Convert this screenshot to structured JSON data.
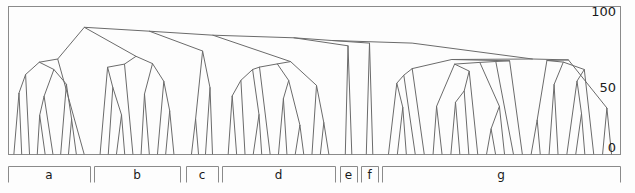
{
  "figure": {
    "type": "dendrogram",
    "plot_box": {
      "x": 8,
      "y": 6,
      "width": 612,
      "height": 148
    },
    "background_color": "#fdfdfd",
    "line_color": "#6b6b6b",
    "axis_color": "#8a8a8a",
    "text_color": "#1a1a1a"
  },
  "axis": {
    "orientation": "right",
    "ticks": [
      {
        "label": "100",
        "value": 100,
        "y": 16
      },
      {
        "label": "50",
        "value": 50,
        "y": 92
      },
      {
        "label": "0",
        "value": 0,
        "y": 152
      }
    ],
    "gridlines": [
      {
        "value": 100,
        "y": 22
      },
      {
        "value": 50,
        "y": 86
      },
      {
        "value": 0,
        "y": 154
      }
    ]
  },
  "groups": [
    {
      "label": "a",
      "x1": 8,
      "x2": 90
    },
    {
      "label": "b",
      "x1": 94,
      "x2": 180
    },
    {
      "label": "c",
      "x1": 186,
      "x2": 218
    },
    {
      "label": "d",
      "x1": 222,
      "x2": 335
    },
    {
      "label": "e",
      "x1": 340,
      "x2": 357
    },
    {
      "label": "f",
      "x1": 361,
      "x2": 378
    },
    {
      "label": "g",
      "x1": 382,
      "x2": 620
    }
  ],
  "bracket": {
    "y_top": 166,
    "y_bottom": 182,
    "label_y": 179
  },
  "chart_data": {
    "type": "dendrogram",
    "title": "",
    "xlabel": "",
    "ylabel": "",
    "ylim": [
      0,
      100
    ],
    "grid": true,
    "legend": "none",
    "categories": [
      "a",
      "b",
      "c",
      "d",
      "e",
      "f",
      "g"
    ],
    "leaves_x": [
      14,
      22,
      30,
      38,
      46,
      54,
      62,
      70,
      78,
      86,
      98,
      106,
      114,
      122,
      130,
      138,
      146,
      154,
      162,
      172,
      190,
      198,
      206,
      214,
      228,
      236,
      244,
      252,
      260,
      268,
      276,
      284,
      292,
      300,
      308,
      316,
      326,
      346,
      352,
      366,
      372,
      388,
      396,
      404,
      412,
      420,
      430,
      440,
      450,
      460,
      470,
      480,
      490,
      500,
      510,
      520,
      530,
      540,
      550,
      560,
      570,
      580,
      590,
      600,
      610
    ],
    "merges": [
      {
        "x": 36,
        "height": 72,
        "children_x": [
          14,
          60
        ],
        "children_h": [
          0,
          30
        ]
      },
      {
        "x": 60,
        "height": 30,
        "children_x": [
          48,
          74
        ],
        "children_h": [
          0,
          18
        ]
      },
      {
        "x": 48,
        "height": 16,
        "children_x": [
          40,
          56
        ],
        "children_h": [
          0,
          0
        ]
      },
      {
        "x": 74,
        "height": 18,
        "children_x": [
          66,
          84
        ],
        "children_h": [
          0,
          0
        ]
      },
      {
        "x": 118,
        "height": 74,
        "children_x": [
          98,
          140
        ],
        "children_h": [
          0,
          54
        ]
      },
      {
        "x": 140,
        "height": 54,
        "children_x": [
          128,
          160
        ],
        "children_h": [
          0,
          0
        ]
      },
      {
        "x": 202,
        "height": 76,
        "children_x": [
          192,
          212
        ],
        "children_h": [
          0,
          0
        ]
      },
      {
        "x": 246,
        "height": 66,
        "children_x": [
          232,
          272
        ],
        "children_h": [
          0,
          42
        ]
      },
      {
        "x": 272,
        "height": 42,
        "children_x": [
          258,
          300
        ],
        "children_h": [
          0,
          48
        ]
      },
      {
        "x": 300,
        "height": 48,
        "children_x": [
          288,
          318
        ],
        "children_h": [
          0,
          0
        ]
      },
      {
        "x": 350,
        "height": 78,
        "children_x": [
          344,
          358
        ],
        "children_h": [
          0,
          0
        ]
      },
      {
        "x": 372,
        "height": 80,
        "children_x": [
          364,
          382
        ],
        "children_h": [
          0,
          0
        ]
      },
      {
        "x": 432,
        "height": 64,
        "children_x": [
          418,
          470
        ],
        "children_h": [
          0,
          34
        ]
      },
      {
        "x": 470,
        "height": 34,
        "children_x": [
          452,
          500
        ],
        "children_h": [
          0,
          22
        ]
      },
      {
        "x": 520,
        "height": 22,
        "children_x": [
          498,
          560
        ],
        "children_h": [
          0,
          14
        ]
      },
      {
        "x": 110,
        "height": 96,
        "children_x": [
          36,
          190
        ],
        "children_h": [
          72,
          80
        ]
      },
      {
        "x": 250,
        "height": 92,
        "children_x": [
          190,
          420
        ],
        "children_h": [
          80,
          86
        ]
      },
      {
        "x": 420,
        "height": 86,
        "children_x": [
          300,
          560
        ],
        "children_h": [
          48,
          40
        ]
      }
    ],
    "polylines": [
      {
        "name": "cluster-a-main",
        "points": "38,76 36,154"
      },
      {
        "name": "root-arc",
        "points": "36,76 120,22 230,36 300,52 380,60 470,88 560,130 612,150"
      },
      "see svg paths"
    ]
  },
  "tree_paths": [
    "M 10,154 L 37,76 L 58,154",
    "M 37,76 L 120,22 L 176,60",
    "M 120,22 L 222,36",
    "M 222,36 L 300,54",
    "M 300,54 L 360,58",
    "M 360,58 L 420,62",
    "M 420,62 L 470,90",
    "M 470,90 L 540,128",
    "M 540,128 L 600,150",
    "M 600,150 L 612,154",
    "M 176,60 L 186,154",
    "M 176,60 L 196,154",
    "M 222,36 L 200,78",
    "M 200,78 L 192,154",
    "M 200,78 L 214,154",
    "M 300,54 L 258,92",
    "M 258,92 L 236,154",
    "M 258,92 L 280,118",
    "M 280,118 L 266,154",
    "M 280,118 L 296,154",
    "M 360,58 L 348,154",
    "M 360,58 L 370,154",
    "M 420,62 L 404,154",
    "M 420,62 L 436,154"
  ],
  "notes": {
    "caption_fragment": ""
  }
}
